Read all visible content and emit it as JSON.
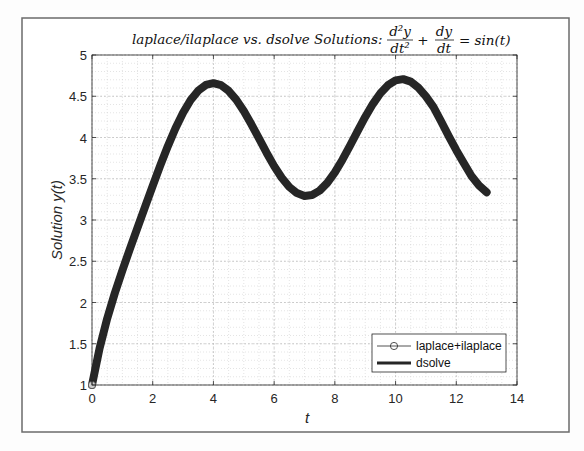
{
  "figure": {
    "title_prefix": "laplace/ilaplace vs. dsolve Solutions:",
    "title_equation": {
      "frac1_num": "d²y",
      "frac1_den": "dt²",
      "plus": "+",
      "frac2_num": "dy",
      "frac2_den": "dt",
      "rhs": "= sin(t)"
    },
    "xlabel": "t",
    "ylabel": "Solution y(t)",
    "colors": {
      "frame": "#6b6b6b",
      "axes": "#262626",
      "grid": "#c8c8c8",
      "line": "#262626",
      "background": "#ffffff"
    }
  },
  "chart_data": {
    "type": "line",
    "xlabel": "t",
    "ylabel": "Solution y(t)",
    "xlim": [
      0,
      14
    ],
    "ylim": [
      1,
      5
    ],
    "xticks": [
      0,
      2,
      4,
      6,
      8,
      10,
      12,
      14
    ],
    "xtick_labels": [
      "0",
      "2",
      "4",
      "6",
      "8",
      "10",
      "12",
      "14"
    ],
    "yticks": [
      1,
      1.5,
      2,
      2.5,
      3,
      3.5,
      4,
      4.5,
      5
    ],
    "ytick_labels": [
      "1",
      "1.5",
      "2",
      "2.5",
      "3",
      "3.5",
      "4",
      "4.5",
      "5"
    ],
    "grid": true,
    "minor_grid": true,
    "legend_position": "southeast",
    "legend": [
      "laplace+ilaplace",
      "dsolve"
    ],
    "x": [
      0,
      0.25,
      0.5,
      0.75,
      1,
      1.25,
      1.5,
      1.75,
      2,
      2.25,
      2.5,
      2.75,
      3,
      3.25,
      3.5,
      3.75,
      4,
      4.25,
      4.5,
      4.75,
      5,
      5.25,
      5.5,
      5.75,
      6,
      6.25,
      6.5,
      6.75,
      7,
      7.25,
      7.5,
      7.75,
      8,
      8.25,
      8.5,
      8.75,
      9,
      9.25,
      9.5,
      9.75,
      10,
      10.25,
      10.5,
      10.75,
      11,
      11.25,
      11.5,
      11.75,
      12,
      12.25,
      12.5,
      12.75,
      13
    ],
    "series": [
      {
        "name": "laplace+ilaplace",
        "style": "thin line with circle markers",
        "visible_markers_x": [
          0
        ],
        "values": [
          1.0,
          1.445,
          1.805,
          2.112,
          2.389,
          2.652,
          2.908,
          3.163,
          3.415,
          3.662,
          3.896,
          4.112,
          4.3,
          4.454,
          4.568,
          4.637,
          4.659,
          4.635,
          4.566,
          4.459,
          4.321,
          4.16,
          3.988,
          3.816,
          3.653,
          3.512,
          3.4,
          3.326,
          3.292,
          3.303,
          3.356,
          3.45,
          3.577,
          3.731,
          3.901,
          4.078,
          4.249,
          4.405,
          4.536,
          4.634,
          4.692,
          4.707,
          4.678,
          4.604,
          4.498,
          4.369,
          4.196,
          4.017,
          3.846,
          3.687,
          3.534,
          3.418,
          3.336
        ]
      },
      {
        "name": "dsolve",
        "style": "thick line",
        "values": [
          1.0,
          1.445,
          1.805,
          2.112,
          2.389,
          2.652,
          2.908,
          3.163,
          3.415,
          3.662,
          3.896,
          4.112,
          4.3,
          4.454,
          4.568,
          4.637,
          4.659,
          4.635,
          4.566,
          4.459,
          4.321,
          4.16,
          3.988,
          3.816,
          3.653,
          3.512,
          3.4,
          3.326,
          3.292,
          3.303,
          3.356,
          3.45,
          3.577,
          3.731,
          3.901,
          4.078,
          4.249,
          4.405,
          4.536,
          4.634,
          4.692,
          4.707,
          4.678,
          4.604,
          4.498,
          4.369,
          4.196,
          4.017,
          3.846,
          3.687,
          3.534,
          3.418,
          3.336
        ]
      }
    ]
  }
}
